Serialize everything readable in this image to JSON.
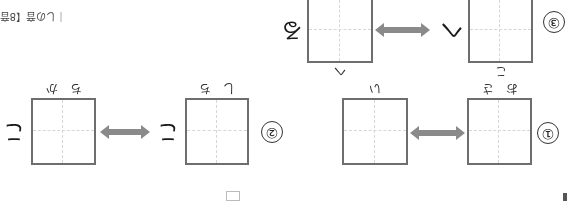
{
  "worksheet": {
    "orientation": "rotated-180",
    "colors": {
      "box_border": "#6e6e6e",
      "guide_line": "#d6d6d6",
      "arrow": "#8a8a8a",
      "text": "#1a1a1a"
    },
    "problems": [
      {
        "number": "①",
        "left_box": {
          "reading": "おさ"
        },
        "right_box": {
          "reading": "い"
        },
        "arrow_icon": "double-arrow"
      },
      {
        "number": "②",
        "left_box": {
          "reading": "しち",
          "kana_after": "こ"
        },
        "right_box": {
          "reading": "ちか",
          "kana_after": "こ"
        },
        "arrow_icon": "double-arrow"
      },
      {
        "number": "③",
        "left_box": {
          "reading": "こ",
          "kana_after": "へ"
        },
        "right_box": {
          "reading": "へ",
          "kana_after": "る"
        },
        "arrow_icon": "double-arrow"
      }
    ],
    "caption": "｜しの音【8音】"
  }
}
